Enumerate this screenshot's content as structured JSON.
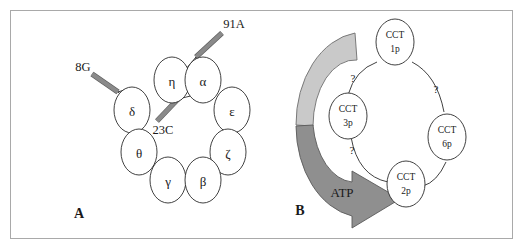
{
  "figure": {
    "panels": [
      {
        "id": "A",
        "label": "A",
        "subunits": [
          {
            "name": "eta",
            "symbol": "η"
          },
          {
            "name": "alpha",
            "symbol": "α"
          },
          {
            "name": "delta",
            "symbol": "δ"
          },
          {
            "name": "epsilon",
            "symbol": "ε"
          },
          {
            "name": "theta",
            "symbol": "θ"
          },
          {
            "name": "zeta",
            "symbol": "ζ"
          },
          {
            "name": "gamma",
            "symbol": "γ"
          },
          {
            "name": "beta",
            "symbol": "β"
          }
        ],
        "annotations": [
          {
            "name": "annotation-91a",
            "text": "91A"
          },
          {
            "name": "annotation-8g",
            "text": "8G"
          },
          {
            "name": "annotation-23c",
            "text": "23C"
          }
        ]
      },
      {
        "id": "B",
        "label": "B",
        "nodes": [
          {
            "name": "cct-1p",
            "line1": "CCT",
            "line2": "1p"
          },
          {
            "name": "cct-3p",
            "line1": "CCT",
            "line2": "3p"
          },
          {
            "name": "cct-6p",
            "line1": "CCT",
            "line2": "6p"
          },
          {
            "name": "cct-2p",
            "line1": "CCT",
            "line2": "2p"
          }
        ],
        "question_marks": [
          {
            "name": "question-mark-top-left",
            "text": "?"
          },
          {
            "name": "question-mark-right",
            "text": "?"
          },
          {
            "name": "question-mark-bottom-left",
            "text": "?"
          }
        ],
        "atp_arrow": {
          "name": "atp-arrow",
          "text": "ATP"
        }
      }
    ]
  },
  "colors": {
    "frame_border": "#a9a9a9",
    "rod_fill": "#8a8a8a",
    "rod_outline": "#5a5a5a",
    "arrow_light": "#c9c9c9",
    "arrow_dark": "#8f8f8f",
    "stroke_dark": "#2b2b2b",
    "background": "#ffffff"
  }
}
